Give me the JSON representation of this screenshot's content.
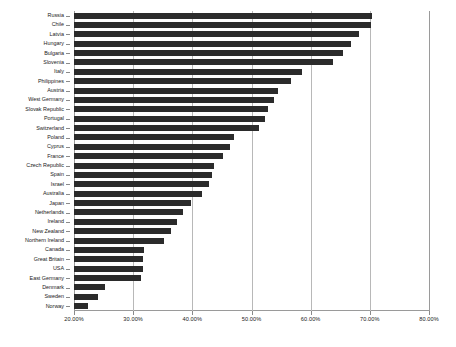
{
  "chart_data": {
    "type": "bar",
    "orientation": "horizontal",
    "title": "",
    "subtitle": "",
    "xlabel": "",
    "ylabel": "",
    "xlim": [
      20.0,
      80.0
    ],
    "xticks": [
      20.0,
      30.0,
      40.0,
      50.0,
      60.0,
      70.0,
      80.0
    ],
    "xtick_labels": [
      "20.00%",
      "30.00%",
      "40.00%",
      "50.00%",
      "60.00%",
      "70.00%",
      "80.00%"
    ],
    "grid": "vertical",
    "legend": "none",
    "bar_color": "#2b2b2b",
    "categories": [
      "Russia",
      "Chile",
      "Latvia",
      "Hungary",
      "Bulgaria",
      "Slovenia",
      "Italy",
      "Philippines",
      "Austria",
      "West Germany",
      "Slovak Republic",
      "Portugal",
      "Switzerland",
      "Poland",
      "Cyprus",
      "France",
      "Czech Republic",
      "Spain",
      "Israel",
      "Australia",
      "Japan",
      "Netherlands",
      "Ireland",
      "New Zealand",
      "Northern Ireland",
      "Canada",
      "Great Britain",
      "USA",
      "East Germany",
      "Denmark",
      "Sweden",
      "Norway"
    ],
    "values": [
      70.4,
      70.2,
      68.2,
      66.8,
      65.4,
      63.8,
      58.6,
      56.6,
      54.4,
      53.8,
      52.8,
      52.2,
      51.2,
      47.0,
      46.4,
      45.2,
      43.6,
      43.4,
      42.8,
      41.6,
      39.8,
      38.4,
      37.4,
      36.4,
      35.2,
      31.8,
      31.6,
      31.6,
      31.4,
      25.2,
      24.0,
      22.4
    ]
  }
}
